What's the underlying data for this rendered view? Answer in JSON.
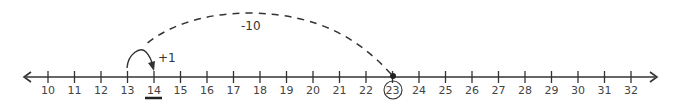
{
  "number_line": {
    "start": 10,
    "end": 32,
    "ticks": [
      10,
      11,
      12,
      13,
      14,
      15,
      16,
      17,
      18,
      19,
      20,
      21,
      22,
      23,
      24,
      25,
      26,
      27,
      28,
      29,
      30,
      31,
      32
    ],
    "highlighted_start": 23,
    "answer": 14
  },
  "jumps": [
    {
      "from": 23,
      "to": 13,
      "label": "-10",
      "style": "dashed"
    },
    {
      "from": 13,
      "to": 14,
      "label": "+1",
      "style": "solid"
    }
  ],
  "colors": {
    "line": "#333333",
    "text": "#444444"
  }
}
